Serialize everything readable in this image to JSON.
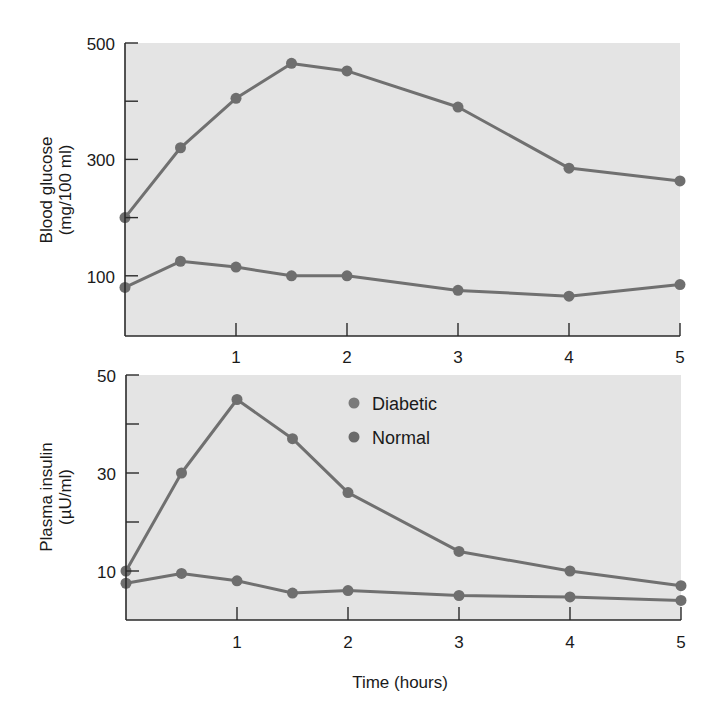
{
  "figure": {
    "x_axis_title": "Time (hours)",
    "legend": [
      {
        "label": "Diabetic"
      },
      {
        "label": "Normal"
      }
    ],
    "colors": {
      "plot_background": "#e4e4e4",
      "series_line": "#707070",
      "series_marker": "#6e6e6e",
      "axis": "#2a2a2a",
      "text": "#1a1a1a"
    }
  },
  "chart_data": [
    {
      "type": "line",
      "title": "",
      "xlabel": "",
      "ylabel": "Blood glucose (mg/100 ml)",
      "ylabel_lines": [
        "Blood glucose",
        "(mg/100 ml)"
      ],
      "x": [
        0,
        0.5,
        1,
        1.5,
        2,
        3,
        4,
        5
      ],
      "xlim": [
        0,
        5
      ],
      "ylim": [
        0,
        500
      ],
      "x_ticks": [
        1,
        2,
        3,
        4,
        5
      ],
      "x_tick_labels": [
        "1",
        "2",
        "3",
        "4",
        "5"
      ],
      "y_ticks": [
        100,
        200,
        300,
        400,
        500
      ],
      "y_tick_labels": [
        "100",
        "",
        "300",
        "",
        "500"
      ],
      "grid": false,
      "series": [
        {
          "name": "Diabetic",
          "values": [
            200,
            320,
            405,
            465,
            452,
            390,
            285,
            263
          ]
        },
        {
          "name": "Normal",
          "values": [
            80,
            125,
            115,
            100,
            100,
            75,
            65,
            85
          ]
        }
      ]
    },
    {
      "type": "line",
      "title": "",
      "xlabel": "Time (hours)",
      "ylabel": "Plasma insulin (µU/ml)",
      "ylabel_lines": [
        "Plasma insulin",
        "(µU/ml)"
      ],
      "x": [
        0,
        0.5,
        1,
        1.5,
        2,
        3,
        4,
        5
      ],
      "xlim": [
        0,
        5
      ],
      "ylim": [
        0,
        50
      ],
      "x_ticks": [
        1,
        2,
        3,
        4,
        5
      ],
      "x_tick_labels": [
        "1",
        "2",
        "3",
        "4",
        "5"
      ],
      "y_ticks": [
        10,
        20,
        30,
        40,
        50
      ],
      "y_tick_labels": [
        "10",
        "",
        "30",
        "",
        "50"
      ],
      "grid": false,
      "legend_position": "upper center inside plot",
      "series": [
        {
          "name": "Diabetic",
          "values": [
            10,
            30,
            45,
            37,
            26,
            14,
            10,
            7
          ]
        },
        {
          "name": "Normal",
          "values": [
            7.5,
            9.5,
            8,
            5.5,
            6,
            5,
            4.7,
            4
          ]
        }
      ]
    }
  ]
}
